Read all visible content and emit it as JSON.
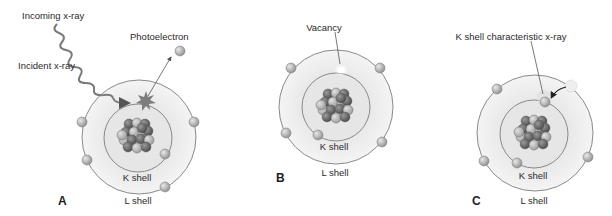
{
  "figure": {
    "panels": [
      {
        "letter": "A",
        "labels": {
          "incoming": "Incoming x-ray",
          "incident": "Incident x-ray",
          "photoelectron": "Photoelectron",
          "k_shell": "K shell",
          "l_shell": "L shell"
        }
      },
      {
        "letter": "B",
        "labels": {
          "vacancy": "Vacancy",
          "k_shell": "K shell",
          "l_shell": "L shell"
        }
      },
      {
        "letter": "C",
        "labels": {
          "characteristic": "K shell characteristic x-ray",
          "k_shell": "K shell",
          "l_shell": "L shell"
        }
      }
    ],
    "colors": {
      "shell_fill": "#ececec",
      "inner_fill": "#e2e2e2",
      "electron": "#b5b5b5",
      "nucleon_dark": "#6e6e6e",
      "nucleon_light": "#c4c4c4",
      "interaction_star": "#7d7d7d"
    }
  }
}
